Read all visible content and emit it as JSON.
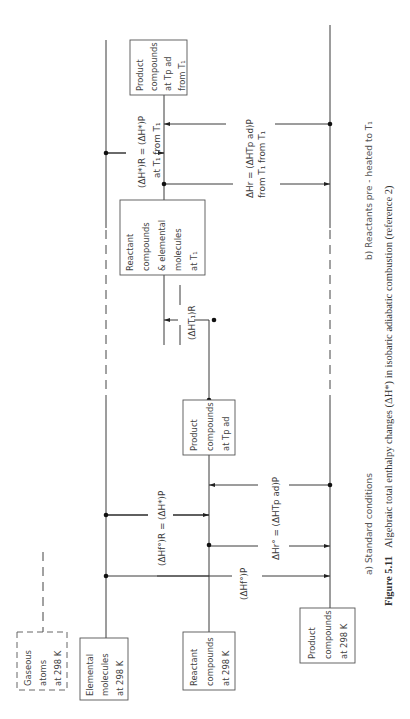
{
  "figure": {
    "number": "Figure 5.11",
    "caption": "Algebraic total enthalpy changes (ΔH*) in isobaric adiabatic combustion (reference 2)"
  },
  "panels": {
    "a": {
      "label": "a)  Standard   conditions"
    },
    "b": {
      "label": "b)  Reactants  pre - heated  to  T₁"
    }
  },
  "boxes": {
    "gaseous_atoms": {
      "lines": [
        "Gaseous",
        "atoms",
        "at  298 K"
      ]
    },
    "elemental_molecules": {
      "lines": [
        "Elemental",
        "molecules",
        "at  298 K"
      ]
    },
    "reactant_compounds_298": {
      "lines": [
        "Reactant",
        "compounds",
        "at  298 K"
      ]
    },
    "product_compounds_tpad": {
      "lines": [
        "Product",
        "compounds",
        "at  Tp ad"
      ]
    },
    "product_compounds_298": {
      "lines": [
        "Product",
        "compounds",
        "at  298 K"
      ]
    },
    "reactants_t1": {
      "lines": [
        "Reactant",
        "compounds",
        "&  elemental",
        "molecules",
        "at  T₁"
      ]
    },
    "product_compounds_tpad_t1": {
      "lines": [
        "Product",
        "compounds",
        "at  Tp ad",
        "from  T₁"
      ]
    }
  },
  "equations": {
    "a_formation_equal": "(ΔHf°)R = (ΔH*)P",
    "a_formation_products": "(ΔHf°)P",
    "a_reaction": "ΔHr°   =   (ΔHTp ad)P",
    "b_heating": "(ΔHT₁)R",
    "b_total_equal_line1": "(ΔH*)R = (ΔH*)P",
    "b_total_equal_line2": "at  T₁        from  T₁",
    "b_reaction_line1": "ΔHr   =   (ΔHTp ad)P",
    "b_reaction_line2": "from T₁      from  T₁"
  }
}
